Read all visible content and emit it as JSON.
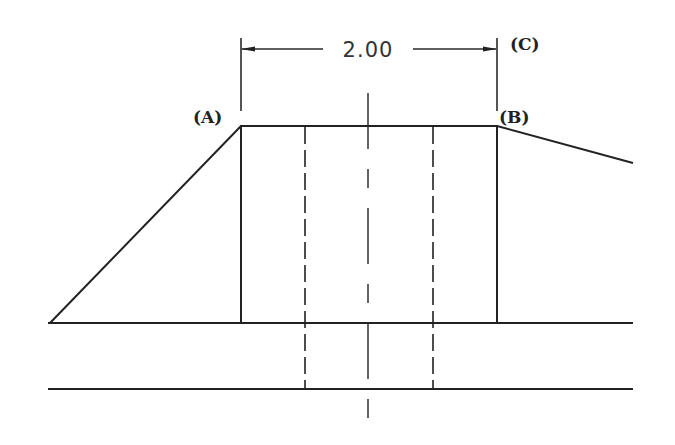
{
  "drawing": {
    "dimension": {
      "value": "2.00",
      "arrow_left_x": 241,
      "arrow_right_x": 497,
      "y": 49
    },
    "labels": {
      "a": "(A)",
      "b": "(B)",
      "c": "(C)"
    },
    "line_color": "#222222",
    "background": "#ffffff"
  }
}
